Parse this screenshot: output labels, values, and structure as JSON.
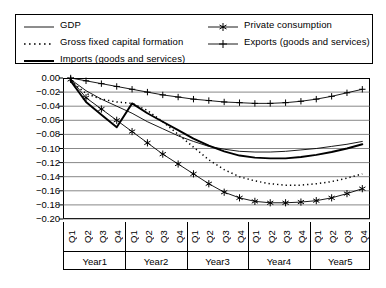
{
  "legend": {
    "items": [
      {
        "label": "GDP",
        "key": "solid-thin",
        "column": "left"
      },
      {
        "label": "Gross fixed capital formation",
        "key": "dotted",
        "column": "left"
      },
      {
        "label": "Imports (goods and services)",
        "key": "solid-thick",
        "column": "left"
      },
      {
        "label": "Private consumption",
        "key": "asterisk-marker",
        "column": "right"
      },
      {
        "label": "Exports (goods and services)",
        "key": "plus-marker",
        "column": "right"
      }
    ]
  },
  "axes": {
    "y_ticks": [
      "0.00",
      "-0.02",
      "-0.04",
      "-0.06",
      "-0.08",
      "-0.10",
      "-0.12",
      "-0.14",
      "-0.16",
      "-0.18",
      "-0.20"
    ],
    "y_min": -0.2,
    "y_max": 0.0,
    "quarter_labels": [
      "Q1",
      "Q2",
      "Q3",
      "Q4"
    ],
    "year_labels": [
      "Year1",
      "Year2",
      "Year3",
      "Year4",
      "Year5"
    ]
  },
  "chart_data": {
    "type": "line",
    "title": "",
    "xlabel": "",
    "ylabel": "",
    "ylim": [
      -0.2,
      0.0
    ],
    "grid": true,
    "legend_position": "top",
    "x": [
      "Year1 Q1",
      "Year1 Q2",
      "Year1 Q3",
      "Year1 Q4",
      "Year2 Q1",
      "Year2 Q2",
      "Year2 Q3",
      "Year2 Q4",
      "Year3 Q1",
      "Year3 Q2",
      "Year3 Q3",
      "Year3 Q4",
      "Year4 Q1",
      "Year4 Q2",
      "Year4 Q3",
      "Year4 Q4",
      "Year5 Q1",
      "Year5 Q2",
      "Year5 Q3",
      "Year5 Q4"
    ],
    "categories": [
      "Q1",
      "Q2",
      "Q3",
      "Q4",
      "Q1",
      "Q2",
      "Q3",
      "Q4",
      "Q1",
      "Q2",
      "Q3",
      "Q4",
      "Q1",
      "Q2",
      "Q3",
      "Q4",
      "Q1",
      "Q2",
      "Q3",
      "Q4"
    ],
    "series": [
      {
        "name": "GDP",
        "style": "solid-thin",
        "marker": "none",
        "values": [
          -0.002,
          -0.018,
          -0.03,
          -0.04,
          -0.05,
          -0.062,
          -0.072,
          -0.082,
          -0.09,
          -0.097,
          -0.101,
          -0.104,
          -0.105,
          -0.105,
          -0.104,
          -0.102,
          -0.1,
          -0.097,
          -0.094,
          -0.09
        ]
      },
      {
        "name": "Gross fixed capital formation",
        "style": "dotted",
        "marker": "none",
        "values": [
          -0.004,
          -0.022,
          -0.03,
          -0.034,
          -0.036,
          -0.046,
          -0.062,
          -0.08,
          -0.098,
          -0.116,
          -0.13,
          -0.14,
          -0.146,
          -0.15,
          -0.152,
          -0.152,
          -0.15,
          -0.147,
          -0.142,
          -0.136
        ]
      },
      {
        "name": "Imports (goods and services)",
        "style": "solid-thick",
        "marker": "none",
        "values": [
          -0.004,
          -0.034,
          -0.052,
          -0.07,
          -0.036,
          -0.05,
          -0.062,
          -0.074,
          -0.086,
          -0.096,
          -0.104,
          -0.11,
          -0.113,
          -0.114,
          -0.114,
          -0.112,
          -0.109,
          -0.105,
          -0.1,
          -0.094
        ]
      },
      {
        "name": "Private consumption",
        "style": "solid-thin",
        "marker": "asterisk",
        "values": [
          -0.002,
          -0.028,
          -0.044,
          -0.06,
          -0.076,
          -0.092,
          -0.108,
          -0.122,
          -0.136,
          -0.15,
          -0.162,
          -0.17,
          -0.175,
          -0.177,
          -0.177,
          -0.176,
          -0.174,
          -0.17,
          -0.164,
          -0.157
        ]
      },
      {
        "name": "Exports (goods and services)",
        "style": "solid-thin",
        "marker": "plus",
        "values": [
          0.0,
          -0.004,
          -0.008,
          -0.012,
          -0.016,
          -0.02,
          -0.024,
          -0.027,
          -0.03,
          -0.032,
          -0.034,
          -0.035,
          -0.036,
          -0.036,
          -0.035,
          -0.033,
          -0.03,
          -0.026,
          -0.021,
          -0.016
        ]
      }
    ]
  }
}
